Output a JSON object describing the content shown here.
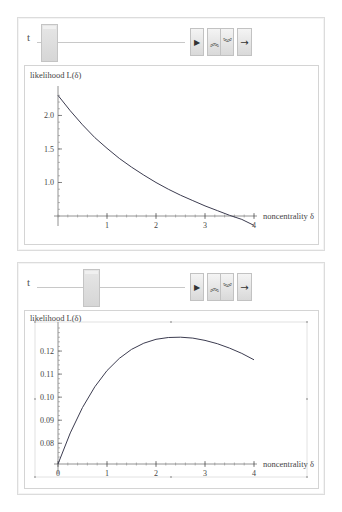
{
  "manipulators": [
    {
      "control": {
        "variable_label": "t",
        "slider_position": 0.03,
        "buttons": [
          {
            "name": "play",
            "icon": "play-icon",
            "glyph": "▶"
          },
          {
            "name": "faster",
            "icon": "double-chevron-up-icon",
            "glyph": "︽"
          },
          {
            "name": "slower",
            "icon": "double-chevron-down-icon",
            "glyph": "︾"
          },
          {
            "name": "direction",
            "icon": "arrow-right-icon",
            "glyph": "→"
          }
        ]
      }
    },
    {
      "control": {
        "variable_label": "t",
        "slider_position": 0.35,
        "buttons": [
          {
            "name": "play",
            "icon": "play-icon",
            "glyph": "▶"
          },
          {
            "name": "faster",
            "icon": "double-chevron-up-icon",
            "glyph": "︽"
          },
          {
            "name": "slower",
            "icon": "double-chevron-down-icon",
            "glyph": "︾"
          },
          {
            "name": "direction",
            "icon": "arrow-right-icon",
            "glyph": "→"
          }
        ]
      }
    }
  ],
  "chart_data": [
    {
      "type": "line",
      "title": "",
      "ylabel": "likelihood L(δ)",
      "xlabel": "noncentrality δ",
      "xlim": [
        0,
        4
      ],
      "ylim": [
        0.5,
        2.35
      ],
      "x_axis_crosses_at": 0.5,
      "xticks": [
        1,
        2,
        3,
        4
      ],
      "xtick_labels": [
        "1",
        "2",
        "3",
        "4"
      ],
      "yticks": [
        1.0,
        1.5,
        2.0
      ],
      "ytick_labels": [
        "1.0",
        "1.5",
        "2.0"
      ],
      "grid": false,
      "selected": false,
      "series": [
        {
          "name": "L(δ)",
          "x": [
            0,
            0.25,
            0.5,
            0.75,
            1.0,
            1.25,
            1.5,
            1.75,
            2.0,
            2.25,
            2.5,
            2.75,
            3.0,
            3.25,
            3.5,
            3.75,
            4.0
          ],
          "y": [
            2.3,
            2.07,
            1.86,
            1.67,
            1.51,
            1.36,
            1.23,
            1.11,
            1.0,
            0.9,
            0.81,
            0.73,
            0.65,
            0.58,
            0.51,
            0.45,
            0.36
          ]
        }
      ]
    },
    {
      "type": "line",
      "title": "",
      "ylabel": "likelihood L(δ)",
      "xlabel": "noncentrality δ",
      "xlim": [
        0,
        4
      ],
      "ylim": [
        0.071,
        0.13
      ],
      "x_axis_crosses_at": 0.071,
      "xticks": [
        0,
        1,
        2,
        3,
        4
      ],
      "xtick_labels": [
        "0",
        "1",
        "2",
        "3",
        "4"
      ],
      "yticks": [
        0.08,
        0.09,
        0.1,
        0.11,
        0.12
      ],
      "ytick_labels": [
        "0.08",
        "0.09",
        "0.10",
        "0.11",
        "0.12"
      ],
      "grid": false,
      "selected": true,
      "series": [
        {
          "name": "L(δ)",
          "x": [
            0,
            0.25,
            0.5,
            0.75,
            1.0,
            1.25,
            1.5,
            1.75,
            2.0,
            2.25,
            2.5,
            2.75,
            3.0,
            3.25,
            3.5,
            3.75,
            4.0
          ],
          "y": [
            0.071,
            0.0845,
            0.0955,
            0.1045,
            0.1115,
            0.1168,
            0.1207,
            0.1234,
            0.1251,
            0.1259,
            0.126,
            0.1256,
            0.1246,
            0.1232,
            0.1213,
            0.119,
            0.1162
          ]
        }
      ]
    }
  ]
}
